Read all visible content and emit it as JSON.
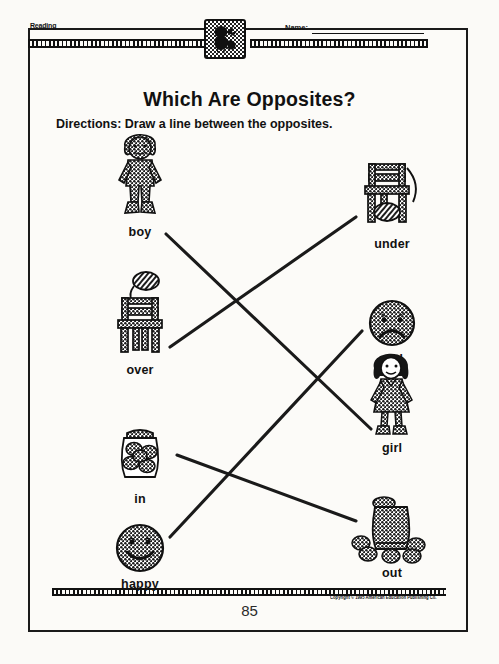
{
  "header": {
    "subject_label": "Reading",
    "name_label": "Name:",
    "name_value": "",
    "badge_icon": "bird-badge-icon"
  },
  "title": "Which Are Opposites?",
  "directions": {
    "label": "Directions:",
    "text": "Draw a line between the opposites."
  },
  "left_column": [
    {
      "caption": "boy",
      "icon": "boy-figure-icon"
    },
    {
      "caption": "over",
      "icon": "ball-over-chair-icon"
    },
    {
      "caption": "in",
      "icon": "cookies-in-jar-icon"
    },
    {
      "caption": "happy",
      "icon": "happy-face-icon"
    }
  ],
  "right_column": [
    {
      "caption": "under",
      "icon": "ball-under-chair-icon"
    },
    {
      "caption": "sad",
      "icon": "sad-face-icon"
    },
    {
      "caption": "girl",
      "icon": "girl-figure-icon"
    },
    {
      "caption": "out",
      "icon": "cookies-out-of-jar-icon"
    }
  ],
  "connections": [
    {
      "from": "boy",
      "to": "girl"
    },
    {
      "from": "over",
      "to": "under"
    },
    {
      "from": "in",
      "to": "out"
    },
    {
      "from": "happy",
      "to": "sad"
    }
  ],
  "footer": {
    "page_number": "85",
    "copyright": "Copyright © 1995 American Education Publishing Co."
  },
  "colors": {
    "ink": "#111111",
    "paper": "#fcfbf8"
  }
}
